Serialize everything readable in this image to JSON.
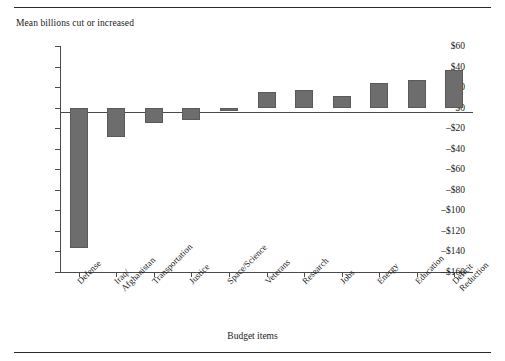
{
  "figure": {
    "y_axis_title": "Mean billions cut or increased",
    "x_axis_title": "Budget items"
  },
  "chart_data": {
    "type": "bar",
    "title": "",
    "xlabel": "Budget items",
    "ylabel": "Mean billions cut or increased",
    "ylim": [
      -160,
      60
    ],
    "ytick_labels": [
      "$60",
      "$40",
      "$20",
      "$0",
      "–$20",
      "–$40",
      "–$60",
      "–$80",
      "–$100",
      "–$120",
      "–$140",
      "–$160"
    ],
    "ytick_values": [
      60,
      40,
      20,
      0,
      -20,
      -40,
      -60,
      -80,
      -100,
      -120,
      -140,
      -160
    ],
    "grid": false,
    "legend": "none",
    "bar_color": "#6d6d6d",
    "categories": [
      "Defense",
      "Iraq/\nAfghanistan",
      "Transportation",
      "Justice",
      "Space/Science",
      "Veterans",
      "Research",
      "Jobs",
      "Energy",
      "Education",
      "Deficit\nReduction"
    ],
    "values": [
      -137,
      -29,
      -15,
      -12,
      -3,
      15,
      17,
      11,
      24,
      27,
      37
    ]
  }
}
